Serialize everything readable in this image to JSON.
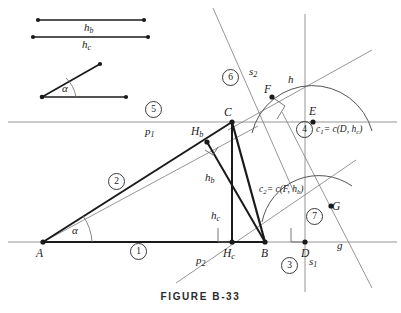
{
  "figure": {
    "caption": "FIGURE B-33",
    "colors": {
      "ink": "#1a1a1a",
      "thick_stroke": "#1a1a1a",
      "thin_stroke": "#8a8a8a",
      "arc_stroke": "#555555",
      "paper": "#ffffff"
    }
  },
  "given_parts": {
    "segment_hb_label": "h",
    "segment_hb_sub": "b",
    "segment_hc_label": "h",
    "segment_hc_sub": "c",
    "angle_label": "α"
  },
  "points": [
    {
      "name": "point-A",
      "label": "A",
      "x": 43,
      "y": 242
    },
    {
      "name": "point-B",
      "label": "B",
      "x": 265,
      "y": 242
    },
    {
      "name": "point-C",
      "label": "C",
      "x": 232,
      "y": 122
    },
    {
      "name": "point-D",
      "label": "D",
      "x": 305,
      "y": 242
    },
    {
      "name": "point-E",
      "label": "E",
      "x": 313,
      "y": 122
    },
    {
      "name": "point-F",
      "label": "F",
      "x": 272,
      "y": 97
    },
    {
      "name": "point-G",
      "label": "G",
      "x": 331,
      "y": 206
    },
    {
      "name": "point-Hb",
      "label": "H",
      "sub": "b",
      "x": 207,
      "y": 142
    },
    {
      "name": "point-Hc",
      "label": "H",
      "sub": "c",
      "x": 232,
      "y": 242
    }
  ],
  "line_labels": [
    {
      "name": "line-label-p1",
      "text": "p",
      "sub": "1",
      "x": 145,
      "y": 126
    },
    {
      "name": "line-label-p2",
      "text": "p",
      "sub": "2",
      "x": 196,
      "y": 258
    },
    {
      "name": "line-label-s1",
      "text": "s",
      "sub": "1",
      "x": 309,
      "y": 258
    },
    {
      "name": "line-label-s2",
      "text": "s",
      "sub": "2",
      "x": 249,
      "y": 72
    },
    {
      "name": "line-label-h",
      "text": "h",
      "x": 288,
      "y": 80
    },
    {
      "name": "line-label-g",
      "text": "g",
      "x": 337,
      "y": 246
    }
  ],
  "inner_labels": [
    {
      "name": "altitude-label-hb",
      "text": "h",
      "sub": "b",
      "x": 211,
      "y": 178
    },
    {
      "name": "altitude-label-hc",
      "text": "h",
      "sub": "c",
      "x": 216,
      "y": 216
    },
    {
      "name": "angle-label-alpha-A",
      "text": "α",
      "x": 72,
      "y": 231
    },
    {
      "name": "angle-label-alpha-given",
      "text": "α",
      "x": 62,
      "y": 89
    }
  ],
  "step_numbers": [
    {
      "name": "step-1",
      "text": "1",
      "x": 137,
      "y": 250
    },
    {
      "name": "step-2",
      "text": "2",
      "x": 115,
      "y": 180
    },
    {
      "name": "step-3",
      "text": "3",
      "x": 288,
      "y": 264
    },
    {
      "name": "step-4",
      "text": "4",
      "x": 303,
      "y": 128
    },
    {
      "name": "step-5",
      "text": "5",
      "x": 152,
      "y": 108
    },
    {
      "name": "step-6",
      "text": "6",
      "x": 229,
      "y": 76
    },
    {
      "name": "step-7",
      "text": "7",
      "x": 313,
      "y": 215
    }
  ],
  "construction_equations": [
    {
      "name": "circle-equation-c1",
      "lead": "c",
      "lead_sub": "1",
      "rest": "= c(D, h",
      "tail_sub": "c",
      "close": ")",
      "x": 320,
      "y": 130
    },
    {
      "name": "circle-equation-c2",
      "lead": "c",
      "lead_sub": "2",
      "rest": "= c(F, h",
      "tail_sub": "b",
      "close": ")",
      "x": 262,
      "y": 190
    }
  ]
}
